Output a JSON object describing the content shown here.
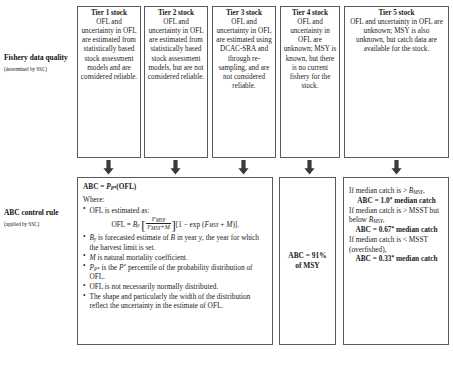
{
  "rows": {
    "data_quality": {
      "title": "Fishery data quality",
      "subtitle": "(determined by SSC)"
    },
    "control_rule": {
      "title": "ABC control rule",
      "subtitle": "(applied by SSC)"
    }
  },
  "tiers": [
    {
      "title": "Tier 1 stock",
      "body": "OFL and uncertainty in OFL are estimated from statistically based stock assessment models and are considered reliable."
    },
    {
      "title": "Tier 2 stock",
      "body": "OFL and uncertainty in OFL are estimated from statistically based stock assessment models, but are not considered reliable."
    },
    {
      "title": "Tier 3 stock",
      "body": "OFL and uncertainty in OFL are estimated using DCAC-SRA and through re-sampling, and are not considered reliable."
    },
    {
      "title": "Tier 4 stock",
      "body": "OFL and uncertainty in OFL are unknown; MSY is known, but there is no current fishery for the stock."
    },
    {
      "title": "Tier 5 stock",
      "body": "OFL and uncertainty in OFL are unknown; MSY is also unknown, but catch data are available for the stock."
    }
  ],
  "abc_tier123": {
    "equation": "ABC = P_P*(OFL)",
    "where_label": "Where:",
    "bullets": [
      "OFL is estimated as:",
      "B_y is forecasted estimate of B in year y, the year for which the harvest limit is set.",
      "M is natural mortality coefficient.",
      "P_P* is the P* percentile of the probability distribution of OFL.",
      "OFL is not necessarily normally distributed.",
      "The shape and particularly the width of the distribution reflect the uncertainty in the estimate of OFL."
    ],
    "ofl_formula": "OFL = B_y [ F_MSY / (F_MSY + M) ][1 - exp (F_MSY + M)].",
    "ofl_parts": {
      "lhs": "OFL = ",
      "b": "B",
      "b_sub": "y",
      "bracket_open": "[",
      "num": "F",
      "num_sub": "MSY",
      "den": "F",
      "den_sub": "MSY",
      "den_tail": "+M",
      "bracket_close": "]",
      "tail_open": "[1 − exp (",
      "tail_f": "F",
      "tail_f_sub": "MSY",
      "tail_mid": " + ",
      "tail_m": "M",
      "tail_close": ")]."
    },
    "bullet_parts": {
      "b2_b": "B",
      "b2_sub": "y",
      "b2_t1": " is forecasted estimate of ",
      "b2_b2": "B",
      "b2_t2": " in year ",
      "b2_y": "y",
      "b2_t3": ", the year for which the harvest limit is set.",
      "b3_m": "M",
      "b3_t": " is natural mortality coefficient.",
      "b4_p": "P",
      "b4_psub": "P*",
      "b4_t1": " is the ",
      "b4_p2": "P",
      "b4_sup": "*",
      "b4_t2": " percentile of the probability distribution of OFL.",
      "b5": "OFL is not necessarily normally distributed.",
      "b6": "The shape and particularly the width of the distribution reflect the uncertainty in the estimate of OFL.",
      "b1": "OFL is estimated as:"
    },
    "eq_parts": {
      "abc": "ABC = ",
      "p": "P",
      "p_sub": "P*",
      "ofl": "(OFL)"
    }
  },
  "abc_tier4": {
    "line1": "ABC = 91%",
    "line2": "of MSY"
  },
  "abc_tier5": {
    "cond1_a": "If median catch is > ",
    "cond1_b": "B",
    "cond1_sub": "MSY",
    "cond1_c": ",",
    "result1_a": "ABC = 1.0",
    "result1_sup": "*",
    "result1_b": " median catch",
    "cond2_a": "If median catch is > MSST but below ",
    "cond2_b": "B",
    "cond2_sub": "MSY",
    "cond2_c": ",",
    "result2_a": "ABC = 0.67",
    "result2_sup": "*",
    "result2_b": " median catch",
    "cond3": "If median catch is < MSST (overfished),",
    "result3_a": "ABC = 0.33",
    "result3_sup": "*",
    "result3_b": " median catch"
  },
  "colors": {
    "border": "#5a5a5a",
    "text": "#1b1b1b",
    "arrow": "#3a3a3a",
    "background": "#ffffff"
  },
  "icons": {
    "arrow": "down-arrow-icon"
  }
}
